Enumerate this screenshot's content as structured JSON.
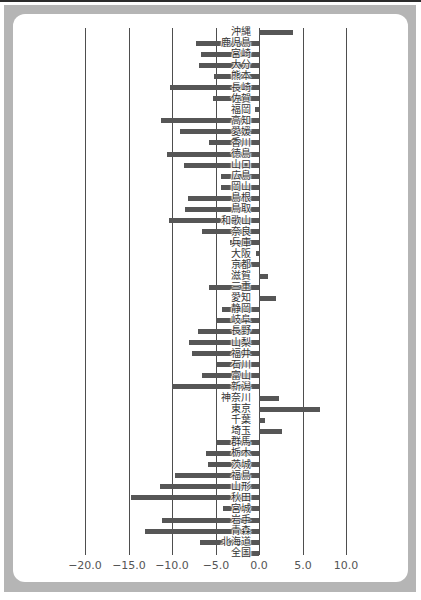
{
  "chart_data": {
    "type": "bar",
    "orientation": "horizontal",
    "title": "",
    "xlabel": "",
    "ylabel": "",
    "categories": [
      "沖縄",
      "鹿児島",
      "宮崎",
      "大分",
      "熊本",
      "長崎",
      "佐賀",
      "福岡",
      "高知",
      "愛媛",
      "香川",
      "徳島",
      "山口",
      "広島",
      "岡山",
      "島根",
      "鳥取",
      "和歌山",
      "奈良",
      "兵庫",
      "大阪",
      "京都",
      "滋賀",
      "三重",
      "愛知",
      "静岡",
      "岐阜",
      "長野",
      "山梨",
      "福井",
      "石川",
      "富山",
      "新潟",
      "神奈川",
      "東京",
      "千葉",
      "埼玉",
      "群馬",
      "栃木",
      "茨城",
      "福島",
      "山形",
      "秋田",
      "宮城",
      "岩手",
      "青森",
      "北海道",
      "全国"
    ],
    "values": [
      3.9,
      -7.2,
      -6.7,
      -6.9,
      -5.2,
      -10.2,
      -5.3,
      -0.5,
      -11.3,
      -9.1,
      -5.8,
      -10.6,
      -8.6,
      -4.4,
      -4.4,
      -8.2,
      -8.5,
      -10.4,
      -6.6,
      -3.3,
      -0.3,
      -2.8,
      1.0,
      -5.8,
      2.0,
      -4.3,
      -5.0,
      -7.0,
      -8.0,
      -7.7,
      -5.0,
      -6.6,
      -10.0,
      2.3,
      7.0,
      0.7,
      2.6,
      -5.0,
      -6.1,
      -5.9,
      -9.7,
      -11.4,
      -14.7,
      -4.1,
      -11.2,
      -13.1,
      -6.8,
      -2.0
    ],
    "xlim": [
      -20,
      10
    ],
    "xticks": [
      -20,
      -15,
      -10,
      -5,
      0,
      5,
      10
    ],
    "xtick_labels": [
      "−20.0",
      "−15.0",
      "−10.0",
      "−5.0",
      "0.0",
      "5.0",
      "10.0"
    ],
    "grid": "vertical lines at each x tick",
    "legend": null
  },
  "style": {
    "bar_color": "#565656",
    "grid_color": "#4e4e4e",
    "frame_color": "#b5b5b5",
    "label_color": "#333333"
  }
}
